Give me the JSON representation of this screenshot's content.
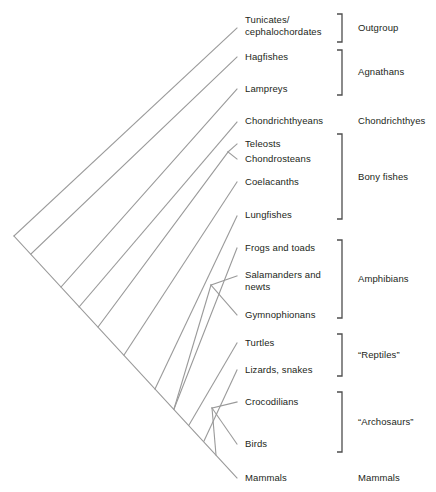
{
  "diagram": {
    "type": "cladogram",
    "line_color": "#9a9a9a",
    "bracket_color": "#4d4d4d",
    "text_color": "#231f20",
    "background": "#ffffff"
  },
  "taxa": [
    {
      "id": "tunicates",
      "label": "Tunicates/\ncephalochordates",
      "tip_x": 237,
      "tip_y": 28,
      "label_x": 245,
      "label_y": 14
    },
    {
      "id": "hagfishes",
      "label": "Hagfishes",
      "tip_x": 237,
      "tip_y": 57,
      "label_x": 245,
      "label_y": 51
    },
    {
      "id": "lampreys",
      "label": "Lampreys",
      "tip_x": 237,
      "tip_y": 89,
      "label_x": 245,
      "label_y": 83
    },
    {
      "id": "chondrichthyeans",
      "label": "Chondrichthyeans",
      "tip_x": 237,
      "tip_y": 122,
      "label_x": 245,
      "label_y": 115
    },
    {
      "id": "teleosts",
      "label": "Teleosts",
      "tip_x": 237,
      "tip_y": 144,
      "label_x": 245,
      "label_y": 138
    },
    {
      "id": "chondrosteans",
      "label": "Chondrosteans",
      "tip_x": 237,
      "tip_y": 159,
      "label_x": 245,
      "label_y": 153
    },
    {
      "id": "coelacanths",
      "label": "Coelacanths",
      "tip_x": 237,
      "tip_y": 182,
      "label_x": 245,
      "label_y": 176
    },
    {
      "id": "lungfishes",
      "label": "Lungfishes",
      "tip_x": 237,
      "tip_y": 216,
      "label_x": 245,
      "label_y": 209
    },
    {
      "id": "frogs",
      "label": "Frogs and toads",
      "tip_x": 237,
      "tip_y": 248,
      "label_x": 245,
      "label_y": 242
    },
    {
      "id": "salamanders",
      "label": "Salamanders and\nnewts",
      "tip_x": 237,
      "tip_y": 276,
      "label_x": 245,
      "label_y": 269
    },
    {
      "id": "gymnophionans",
      "label": "Gymnophionans",
      "tip_x": 237,
      "tip_y": 315,
      "label_x": 245,
      "label_y": 309
    },
    {
      "id": "turtles",
      "label": "Turtles",
      "tip_x": 237,
      "tip_y": 343,
      "label_x": 245,
      "label_y": 337
    },
    {
      "id": "lizards",
      "label": "Lizards, snakes",
      "tip_x": 237,
      "tip_y": 370,
      "label_x": 245,
      "label_y": 364
    },
    {
      "id": "crocodilians",
      "label": "Crocodilians",
      "tip_x": 237,
      "tip_y": 402,
      "label_x": 245,
      "label_y": 396
    },
    {
      "id": "birds",
      "label": "Birds",
      "tip_x": 237,
      "tip_y": 444,
      "label_x": 245,
      "label_y": 438
    },
    {
      "id": "mammals",
      "label": "Mammals",
      "tip_x": 237,
      "tip_y": 478,
      "label_x": 245,
      "label_y": 472
    }
  ],
  "groups": [
    {
      "id": "outgroup",
      "label": "Outgroup",
      "bracket_top": 14,
      "bracket_bottom": 42,
      "label_x": 358,
      "label_y": 22
    },
    {
      "id": "agnathans",
      "label": "Agnathans",
      "bracket_top": 50,
      "bracket_bottom": 95,
      "label_x": 358,
      "label_y": 66
    },
    {
      "id": "chondrichthyes",
      "label": "Chondrichthyes",
      "bracket_top": null,
      "bracket_bottom": null,
      "label_x": 358,
      "label_y": 115
    },
    {
      "id": "bony-fishes",
      "label": "Bony fishes",
      "bracket_top": 134,
      "bracket_bottom": 219,
      "label_x": 358,
      "label_y": 171
    },
    {
      "id": "amphibians",
      "label": "Amphibians",
      "bracket_top": 240,
      "bracket_bottom": 318,
      "label_x": 358,
      "label_y": 273
    },
    {
      "id": "reptiles",
      "label": "“Reptiles”",
      "bracket_top": 334,
      "bracket_bottom": 376,
      "label_x": 358,
      "label_y": 349
    },
    {
      "id": "archosaurs",
      "label": "“Archosaurs”",
      "bracket_top": 392,
      "bracket_bottom": 452,
      "label_x": 358,
      "label_y": 416
    },
    {
      "id": "mammals-group",
      "label": "Mammals",
      "bracket_top": null,
      "bracket_bottom": null,
      "label_x": 358,
      "label_y": 472
    }
  ],
  "bracket_x": 342,
  "bracket_tick": 5
}
